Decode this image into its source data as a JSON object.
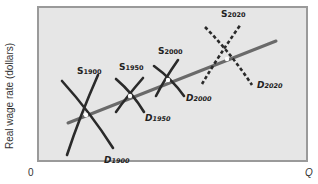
{
  "chart_data": {
    "type": "line",
    "title": "",
    "xlabel": "Q",
    "ylabel": "Real wage rate (dollars)",
    "x_origin_label": "0",
    "grid": false,
    "legend": "none",
    "colors": {
      "plot_bg": "#e6e6e6",
      "frame": "#9a9a9a",
      "curve": "#2a2a2a",
      "trend": "#6a6a6a",
      "equilibrium": "#ffffff"
    },
    "trend_line": {
      "name": "long-run wage trend",
      "from": [
        68,
        123
      ],
      "to": [
        276,
        41
      ]
    },
    "series": [
      {
        "name": "S1900",
        "label_main": "S",
        "label_sub": "1900",
        "kind": "supply",
        "style": "solid",
        "from": [
          67,
          155
        ],
        "to": [
          98,
          75
        ],
        "label_pos": [
          77,
          66
        ]
      },
      {
        "name": "D1900",
        "label_main": "D",
        "label_sub": "1900",
        "kind": "demand",
        "style": "solid",
        "from": [
          62,
          81
        ],
        "to": [
          113,
          148
        ],
        "label_pos": [
          104,
          155
        ]
      },
      {
        "name": "S1950",
        "label_main": "S",
        "label_sub": "1950",
        "kind": "supply",
        "style": "solid",
        "from": [
          116,
          112
        ],
        "to": [
          143,
          78
        ],
        "label_pos": [
          119,
          62
        ]
      },
      {
        "name": "D1950",
        "label_main": "D",
        "label_sub": "1950",
        "kind": "demand",
        "style": "solid",
        "from": [
          116,
          79
        ],
        "to": [
          144,
          112
        ],
        "label_pos": [
          145,
          113
        ]
      },
      {
        "name": "S2000",
        "label_main": "S",
        "label_sub": "2000",
        "kind": "supply",
        "style": "solid",
        "from": [
          156,
          96
        ],
        "to": [
          178,
          60
        ],
        "label_pos": [
          158,
          46
        ]
      },
      {
        "name": "D2000",
        "label_main": "D",
        "label_sub": "2000",
        "kind": "demand",
        "style": "solid",
        "from": [
          154,
          66
        ],
        "to": [
          184,
          96
        ],
        "label_pos": [
          186,
          93
        ]
      },
      {
        "name": "S2020",
        "label_main": "S",
        "label_sub": "2020",
        "kind": "supply",
        "style": "dashed",
        "from": [
          202,
          84
        ],
        "to": [
          241,
          24
        ],
        "label_pos": [
          221,
          9
        ]
      },
      {
        "name": "D2020",
        "label_main": "D",
        "label_sub": "2020",
        "kind": "demand",
        "style": "dashed",
        "from": [
          205,
          27
        ],
        "to": [
          252,
          85
        ],
        "label_pos": [
          257,
          80
        ]
      }
    ],
    "equilibria": [
      {
        "year": "1900",
        "point": [
          86,
          115
        ]
      },
      {
        "year": "1950",
        "point": [
          130,
          96
        ]
      },
      {
        "year": "2000",
        "point": [
          168,
          80
        ]
      },
      {
        "year": "2020",
        "point": [
          227,
          59
        ]
      }
    ],
    "plot_frame": {
      "x": 38,
      "y": 7,
      "width": 269,
      "height": 154
    }
  }
}
